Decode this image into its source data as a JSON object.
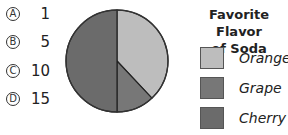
{
  "question": {
    "choices": [
      {
        "letter": "A",
        "value": "1"
      },
      {
        "letter": "B",
        "value": "5"
      },
      {
        "letter": "C",
        "value": "10"
      },
      {
        "letter": "D",
        "value": "15"
      }
    ]
  },
  "legend": {
    "title_line1": "Favorite Flavor",
    "title_line2": "of Soda",
    "items": [
      {
        "label": "Orange",
        "color": "#bdbdbd"
      },
      {
        "label": "Grape",
        "color": "#777777"
      },
      {
        "label": "Cherry",
        "color": "#6b6b6b"
      }
    ]
  },
  "chart_data": {
    "type": "pie",
    "title": "Favorite Flavor of Soda",
    "categories": [
      "Orange",
      "Grape",
      "Cherry"
    ],
    "values": [
      38,
      12,
      50
    ],
    "colors": [
      "#bdbdbd",
      "#777777",
      "#6b6b6b"
    ],
    "legend_position": "right",
    "start_angle": "12 o'clock, clockwise"
  }
}
